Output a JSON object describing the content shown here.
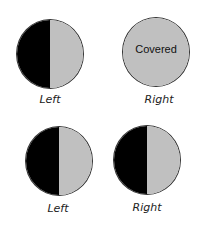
{
  "figure": {
    "top_row": {
      "left": {
        "label": "Left",
        "state": "half-dark-half-light"
      },
      "right": {
        "label": "Right",
        "state": "covered",
        "overlay_text": "Covered"
      }
    },
    "bottom_row": {
      "left": {
        "label": "Left",
        "state": "half-dark-half-light"
      },
      "right": {
        "label": "Right",
        "state": "half-dark-half-light"
      }
    },
    "colors": {
      "dark": "#000000",
      "light": "#c0c0c0",
      "outline": "#333333"
    }
  }
}
